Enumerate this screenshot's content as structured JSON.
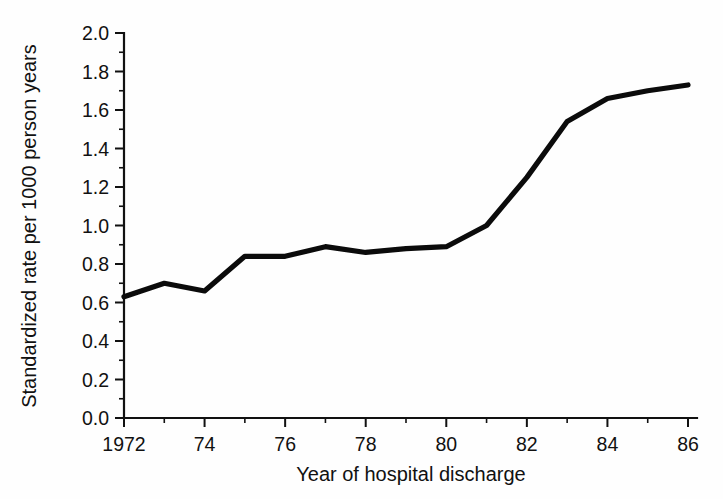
{
  "chart_data": {
    "type": "line",
    "title": "",
    "xlabel": "Year of hospital discharge",
    "ylabel": "Standardized rate per 1000 person years",
    "xlim": [
      1972,
      1986
    ],
    "ylim": [
      0.0,
      2.0
    ],
    "grid": false,
    "legend": "none",
    "x_tick_labels": [
      "1972",
      "74",
      "76",
      "78",
      "80",
      "82",
      "84",
      "86"
    ],
    "x_tick_values": [
      1972,
      1974,
      1976,
      1978,
      1980,
      1982,
      1984,
      1986
    ],
    "x_minor_tick_values": [
      1973,
      1975,
      1977,
      1979,
      1981,
      1983,
      1985
    ],
    "y_tick_labels": [
      "0.0",
      "0.2",
      "0.4",
      "0.6",
      "0.8",
      "1.0",
      "1.2",
      "1.4",
      "1.6",
      "1.8",
      "2.0"
    ],
    "y_tick_values": [
      0.0,
      0.2,
      0.4,
      0.6,
      0.8,
      1.0,
      1.2,
      1.4,
      1.6,
      1.8,
      2.0
    ],
    "y_minor_tick_values": [
      0.1,
      0.3,
      0.5,
      0.7,
      0.9,
      1.1,
      1.3,
      1.5,
      1.7,
      1.9
    ],
    "series": [
      {
        "name": "Standardized rate",
        "color": "#0b0b0b",
        "x": [
          1972,
          1973,
          1974,
          1975,
          1976,
          1977,
          1978,
          1979,
          1980,
          1981,
          1982,
          1983,
          1984,
          1985,
          1986
        ],
        "values": [
          0.63,
          0.7,
          0.66,
          0.84,
          0.84,
          0.89,
          0.86,
          0.88,
          0.89,
          1.0,
          1.25,
          1.54,
          1.66,
          1.7,
          1.73
        ]
      }
    ]
  },
  "labels": {
    "x_axis_title": "Year of hospital discharge",
    "y_axis_title": "Standardized rate per 1000 person years"
  }
}
